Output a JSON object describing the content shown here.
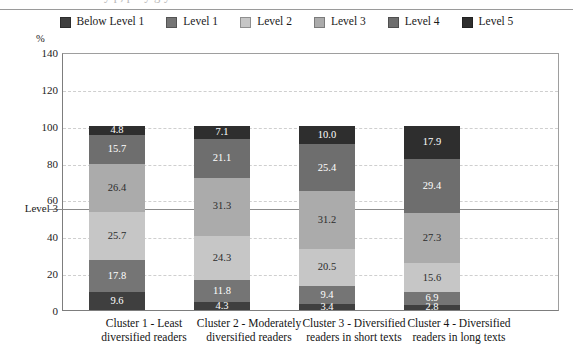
{
  "chart_data": {
    "type": "bar",
    "subtype": "stacked-bar",
    "title": "",
    "xlabel": "",
    "ylabel": "%",
    "ylim": [
      0,
      140
    ],
    "ytick_step": 20,
    "yticks": [
      "140",
      "120",
      "100",
      "80",
      "60",
      "40",
      "20",
      "0"
    ],
    "grid": true,
    "legend_position": "top-center",
    "categories": [
      "Cluster 1 - Least diversified readers",
      "Cluster 2 - Moderately diversified readers",
      "Cluster 3 - Diversified readers in short texts",
      "Cluster 4 - Diversified readers in long texts"
    ],
    "series": [
      {
        "name": "Below Level 1",
        "color": "#3f3f3f",
        "text_color": "#ffffff",
        "values": [
          9.6,
          4.3,
          3.4,
          2.8
        ]
      },
      {
        "name": "Level 1",
        "color": "#757575",
        "text_color": "#ffffff",
        "values": [
          17.8,
          11.8,
          9.4,
          6.9
        ]
      },
      {
        "name": "Level 2",
        "color": "#c6c6c6",
        "text_color": "#2b2b2b",
        "values": [
          25.7,
          24.3,
          20.5,
          15.6
        ]
      },
      {
        "name": "Level 3",
        "color": "#ababab",
        "text_color": "#2b2b2b",
        "values": [
          26.4,
          31.3,
          31.2,
          27.3
        ]
      },
      {
        "name": "Level 4",
        "color": "#6e6e6e",
        "text_color": "#ffffff",
        "values": [
          15.7,
          21.1,
          25.4,
          29.4
        ]
      },
      {
        "name": "Level 5",
        "color": "#2e2e2e",
        "text_color": "#ffffff",
        "values": [
          4.8,
          7.1,
          10.0,
          17.9
        ]
      }
    ],
    "reference_line": {
      "label": "Level 3",
      "value": 56
    },
    "value_labels": {
      "cluster1": [
        "9.6",
        "17.8",
        "25.7",
        "26.4",
        "15.7",
        "4.8"
      ],
      "cluster2": [
        "4.3",
        "11.8",
        "24.3",
        "31.3",
        "21.1",
        "7.1"
      ],
      "cluster3": [
        "3.4",
        "9.4",
        "20.5",
        "31.2",
        "25.4",
        "10.0"
      ],
      "cluster4": [
        "2.8",
        "6.9",
        "15.6",
        "27.3",
        "29.4",
        "17.9"
      ]
    }
  },
  "legend": {
    "items": [
      {
        "label": "Below Level 1"
      },
      {
        "label": "Level 1"
      },
      {
        "label": "Level 2"
      },
      {
        "label": "Level 3"
      },
      {
        "label": "Level 4"
      },
      {
        "label": "Level 5"
      }
    ]
  },
  "axis": {
    "percent_symbol": "%",
    "level3_label": "Level 3"
  },
  "xlabels": [
    {
      "line1": "Cluster 1 - Least",
      "line2": "diversified readers"
    },
    {
      "line1": "Cluster 2 - Moderately",
      "line2": "diversified readers"
    },
    {
      "line1": "Cluster 3 - Diversified",
      "line2": "readers in short texts"
    },
    {
      "line1": "Cluster 4 - Diversified",
      "line2": "readers in long texts"
    }
  ],
  "title_sliver": {
    "text": "y    p, p  f  y                              g    y"
  }
}
